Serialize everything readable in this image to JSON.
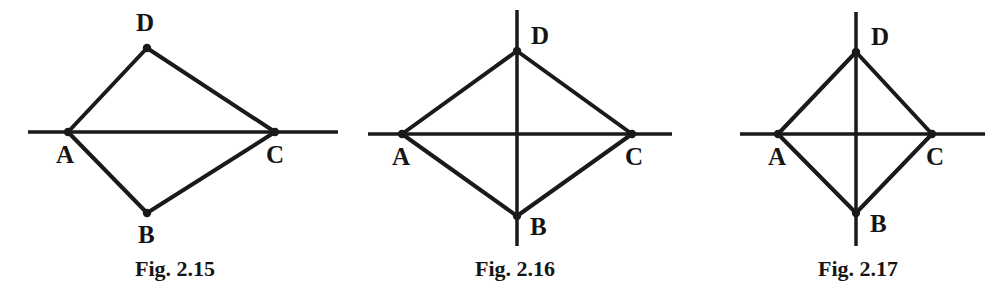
{
  "document": {
    "kind": "geometry-figure-plate",
    "background_color": "#ffffff",
    "ink_color": "#1a1a1a",
    "width": 993,
    "height": 299,
    "figure_count": 3
  },
  "figures": [
    {
      "id": "fig-2-15",
      "caption": "Fig. 2.15",
      "caption_x": 175,
      "caption_y": 258,
      "description": "Kite ABCD with a single horizontal axis line through A and C; quadrilateral is asymmetric about the vertical direction",
      "axes": [
        {
          "name": "horizontal-axis",
          "orientation": "horizontal",
          "x1": 28,
          "y1": 132,
          "x2": 338,
          "y2": 132
        }
      ],
      "vertices": [
        {
          "label": "A",
          "x": 68,
          "y": 132,
          "label_x": 56,
          "label_y": 142
        },
        {
          "label": "B",
          "x": 147,
          "y": 213,
          "label_x": 138,
          "label_y": 222
        },
        {
          "label": "C",
          "x": 275,
          "y": 132,
          "label_x": 266,
          "label_y": 142
        },
        {
          "label": "D",
          "x": 147,
          "y": 48,
          "label_x": 136,
          "label_y": 10
        }
      ],
      "edges": [
        {
          "from": "A",
          "to": "D"
        },
        {
          "from": "D",
          "to": "C"
        },
        {
          "from": "C",
          "to": "B"
        },
        {
          "from": "B",
          "to": "A"
        }
      ],
      "diagonals_drawn": [
        "A-C"
      ]
    },
    {
      "id": "fig-2-16",
      "caption": "Fig. 2.16",
      "caption_x": 515,
      "caption_y": 258,
      "description": "Rhombus-like kite ABCD with both horizontal axis through A,C and vertical axis through D,B drawn as full crossing lines",
      "axes": [
        {
          "name": "horizontal-axis",
          "orientation": "horizontal",
          "x1": 368,
          "y1": 134,
          "x2": 672,
          "y2": 134
        },
        {
          "name": "vertical-axis",
          "orientation": "vertical",
          "x1": 517,
          "y1": 10,
          "x2": 517,
          "y2": 246
        }
      ],
      "vertices": [
        {
          "label": "A",
          "x": 402,
          "y": 134,
          "label_x": 392,
          "label_y": 144
        },
        {
          "label": "B",
          "x": 517,
          "y": 216,
          "label_x": 530,
          "label_y": 214
        },
        {
          "label": "C",
          "x": 632,
          "y": 134,
          "label_x": 625,
          "label_y": 144
        },
        {
          "label": "D",
          "x": 517,
          "y": 51,
          "label_x": 531,
          "label_y": 23
        }
      ],
      "edges": [
        {
          "from": "A",
          "to": "D"
        },
        {
          "from": "D",
          "to": "C"
        },
        {
          "from": "C",
          "to": "B"
        },
        {
          "from": "B",
          "to": "A"
        }
      ],
      "diagonals_drawn": [
        "A-C",
        "D-B"
      ]
    },
    {
      "id": "fig-2-17",
      "caption": "Fig. 2.17",
      "caption_x": 858,
      "caption_y": 258,
      "description": "Narrower kite ABCD with both horizontal axis through A,C and vertical axis through D,B drawn as full crossing lines",
      "axes": [
        {
          "name": "horizontal-axis",
          "orientation": "horizontal",
          "x1": 740,
          "y1": 134,
          "x2": 985,
          "y2": 134
        },
        {
          "name": "vertical-axis",
          "orientation": "vertical",
          "x1": 856,
          "y1": 12,
          "x2": 856,
          "y2": 246
        }
      ],
      "vertices": [
        {
          "label": "A",
          "x": 778,
          "y": 134,
          "label_x": 768,
          "label_y": 144
        },
        {
          "label": "B",
          "x": 856,
          "y": 213,
          "label_x": 870,
          "label_y": 211
        },
        {
          "label": "C",
          "x": 932,
          "y": 134,
          "label_x": 926,
          "label_y": 144
        },
        {
          "label": "D",
          "x": 856,
          "y": 52,
          "label_x": 871,
          "label_y": 24
        }
      ],
      "edges": [
        {
          "from": "A",
          "to": "D"
        },
        {
          "from": "D",
          "to": "C"
        },
        {
          "from": "C",
          "to": "B"
        },
        {
          "from": "B",
          "to": "A"
        }
      ],
      "diagonals_drawn": [
        "A-C",
        "D-B"
      ]
    }
  ],
  "style": {
    "edge_stroke_width": 4,
    "axis_stroke_width": 3.5,
    "vertex_dot_radius": 4.2,
    "stroke_color": "#1a1a1a"
  }
}
